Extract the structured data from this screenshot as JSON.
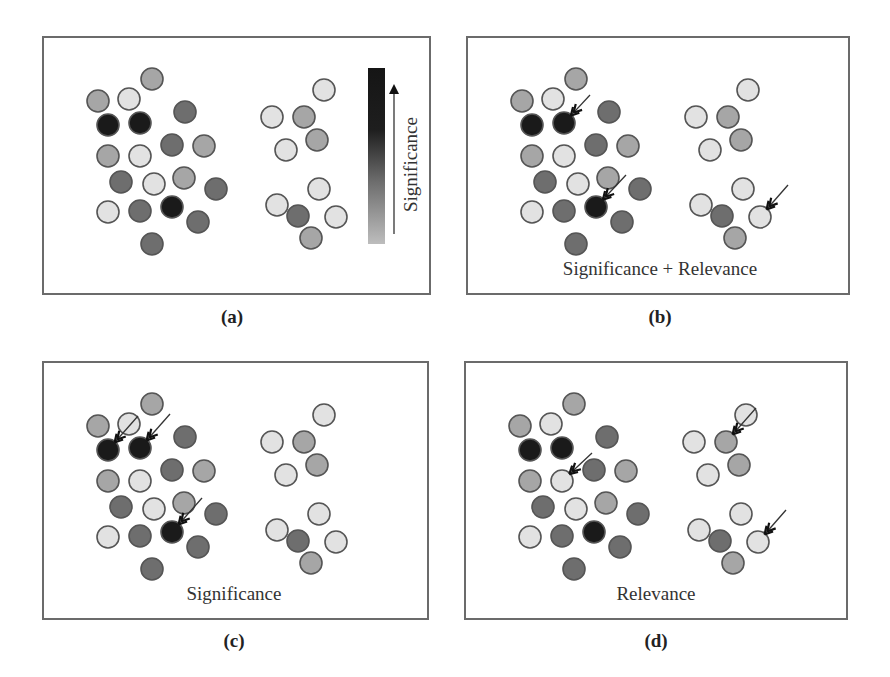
{
  "figure": {
    "colors": {
      "black": "#1a1a1a",
      "dark": "#6e6e6e",
      "medium": "#a6a6a6",
      "light": "#e2e2e2",
      "border": "#555555",
      "arrow": "#333333"
    },
    "legend": {
      "label": "Significance",
      "gradient_from": "#bdbdbd",
      "gradient_to": "#151515"
    },
    "circles": [
      {
        "x": 152,
        "y": 79,
        "shade": "medium"
      },
      {
        "x": 98,
        "y": 101,
        "shade": "medium"
      },
      {
        "x": 129,
        "y": 99,
        "shade": "light"
      },
      {
        "x": 108,
        "y": 125,
        "shade": "black"
      },
      {
        "x": 140,
        "y": 123,
        "shade": "black"
      },
      {
        "x": 185,
        "y": 112,
        "shade": "dark"
      },
      {
        "x": 108,
        "y": 156,
        "shade": "medium"
      },
      {
        "x": 140,
        "y": 156,
        "shade": "light"
      },
      {
        "x": 172,
        "y": 145,
        "shade": "dark"
      },
      {
        "x": 204,
        "y": 146,
        "shade": "medium"
      },
      {
        "x": 121,
        "y": 182,
        "shade": "dark"
      },
      {
        "x": 154,
        "y": 184,
        "shade": "light"
      },
      {
        "x": 184,
        "y": 178,
        "shade": "medium"
      },
      {
        "x": 216,
        "y": 189,
        "shade": "dark"
      },
      {
        "x": 108,
        "y": 212,
        "shade": "light"
      },
      {
        "x": 140,
        "y": 211,
        "shade": "dark"
      },
      {
        "x": 172,
        "y": 207,
        "shade": "black"
      },
      {
        "x": 198,
        "y": 222,
        "shade": "dark"
      },
      {
        "x": 152,
        "y": 244,
        "shade": "dark"
      },
      {
        "x": 324,
        "y": 90,
        "shade": "light"
      },
      {
        "x": 272,
        "y": 117,
        "shade": "light"
      },
      {
        "x": 304,
        "y": 117,
        "shade": "medium"
      },
      {
        "x": 286,
        "y": 150,
        "shade": "light"
      },
      {
        "x": 317,
        "y": 140,
        "shade": "medium"
      },
      {
        "x": 319,
        "y": 189,
        "shade": "light"
      },
      {
        "x": 277,
        "y": 205,
        "shade": "light"
      },
      {
        "x": 298,
        "y": 216,
        "shade": "dark"
      },
      {
        "x": 336,
        "y": 217,
        "shade": "light"
      },
      {
        "x": 311,
        "y": 238,
        "shade": "medium"
      }
    ],
    "panels": [
      {
        "id": "a",
        "caption": "(a)",
        "label": "",
        "box": {
          "x": 42,
          "y": 36,
          "w": 389,
          "h": 259
        },
        "offset": {
          "dx": 0,
          "dy": 0
        },
        "caption_pos": {
          "x": 232,
          "y": 306
        },
        "show_legend": true,
        "arrows": []
      },
      {
        "id": "b",
        "caption": "(b)",
        "label": "Significance + Relevance",
        "box": {
          "x": 466,
          "y": 36,
          "w": 384,
          "h": 259
        },
        "offset": {
          "dx": 424,
          "dy": 0
        },
        "caption_pos": {
          "x": 660,
          "y": 306
        },
        "label_pos": {
          "x": 660,
          "y": 258
        },
        "show_legend": false,
        "arrows": [
          {
            "target": 4,
            "from": [
              18,
              -20
            ]
          },
          {
            "target": 16,
            "from": [
              22,
              -24
            ]
          },
          {
            "target": 27,
            "from": [
              20,
              -24
            ]
          }
        ]
      },
      {
        "id": "c",
        "caption": "(c)",
        "label": "Significance",
        "box": {
          "x": 42,
          "y": 361,
          "w": 387,
          "h": 259
        },
        "offset": {
          "dx": 0,
          "dy": 325
        },
        "caption_pos": {
          "x": 234,
          "y": 630
        },
        "label_pos": {
          "x": 234,
          "y": 583
        },
        "show_legend": false,
        "arrows": [
          {
            "target": 3,
            "from": [
              22,
              -26
            ]
          },
          {
            "target": 4,
            "from": [
              22,
              -26
            ]
          },
          {
            "target": 16,
            "from": [
              22,
              -26
            ]
          }
        ]
      },
      {
        "id": "d",
        "caption": "(d)",
        "label": "Relevance",
        "box": {
          "x": 464,
          "y": 361,
          "w": 384,
          "h": 259
        },
        "offset": {
          "dx": 422,
          "dy": 325
        },
        "caption_pos": {
          "x": 656,
          "y": 630
        },
        "label_pos": {
          "x": 656,
          "y": 583
        },
        "show_legend": false,
        "arrows": [
          {
            "target": 7,
            "from": [
              22,
              -20
            ]
          },
          {
            "target": 21,
            "from": [
              22,
              -26
            ]
          },
          {
            "target": 27,
            "from": [
              20,
              -24
            ]
          }
        ]
      }
    ]
  }
}
